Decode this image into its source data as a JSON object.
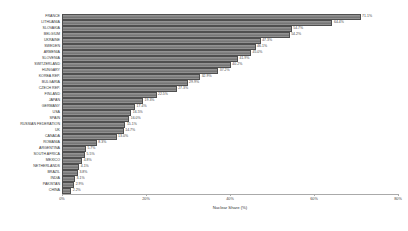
{
  "chart_data": {
    "type": "bar",
    "orientation": "horizontal",
    "title": "",
    "xlabel": "Nuclear Share (%)",
    "ylabel": "",
    "xlim": [
      0,
      80
    ],
    "xticks": [
      "0%",
      "20%",
      "40%",
      "60%",
      "80%"
    ],
    "xtick_values": [
      0,
      20,
      40,
      60,
      80
    ],
    "grid": false,
    "legend": "none",
    "value_label_suffix": "%",
    "categories": [
      "FRANCE",
      "LITHUANIA",
      "SLOVAKIA",
      "BELGIUM",
      "UKRAINE",
      "SWEDEN",
      "ARMENIA",
      "SLOVENIA",
      "SWITZERLAND",
      "HUNGARY",
      "KOREA REP.",
      "BULGARIA",
      "CZECH REP.",
      "FINLAND",
      "JAPAN",
      "GERMANY",
      "USA",
      "SPAIN",
      "RUSSIAN FEDERATION",
      "UK",
      "CANADA",
      "ROMANIA",
      "ARGENTINA",
      "SOUTH AFRICA",
      "MEXICO",
      "NETHERLANDS",
      "BRAZIL",
      "INDIA",
      "PAKISTAN",
      "CHINA"
    ],
    "values": [
      71.1,
      64.4,
      54.7,
      54.2,
      47.3,
      46.1,
      45.0,
      41.9,
      40.2,
      37.2,
      32.9,
      29.9,
      27.3,
      22.5,
      19.3,
      17.4,
      16.5,
      16.0,
      15.1,
      14.7,
      13.0,
      8.3,
      5.7,
      5.5,
      4.8,
      4.1,
      3.8,
      3.1,
      2.9,
      2.2
    ],
    "value_labels": [
      "71.1%",
      "64.4%",
      "54.7%",
      "54.2%",
      "47.3%",
      "46.1%",
      "45.0%",
      "41.9%",
      "40.2%",
      "37.2%",
      "32.9%",
      "29.9%",
      "27.3%",
      "22.5%",
      "19.3%",
      "17.4%",
      "16.5%",
      "16.0%",
      "15.1%",
      "14.7%",
      "13.0%",
      "8.3%",
      "5.7%",
      "5.5%",
      "4.8%",
      "4.1%",
      "3.8%",
      "3.1%",
      "2.9%",
      "2.2%"
    ],
    "colors": {
      "bar_fill": "#7f7f7f",
      "bar_edge": "#4f4f4f",
      "axis": "#aaaaaa",
      "text": "#333333",
      "background": "#ffffff"
    }
  }
}
